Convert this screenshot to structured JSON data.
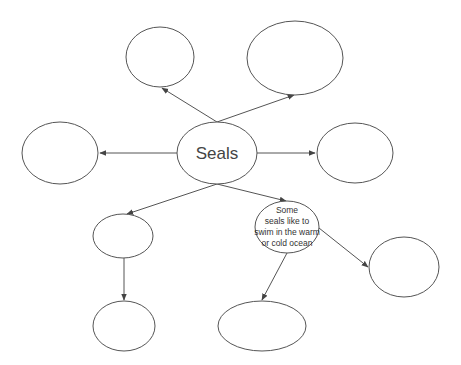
{
  "diagram": {
    "type": "concept-map",
    "colors": {
      "stroke": "#555555",
      "text": "#444444",
      "background": "#ffffff"
    },
    "center": {
      "id": "seals",
      "label": "Seals"
    },
    "nodes": [
      {
        "id": "seals",
        "label": "Seals"
      },
      {
        "id": "top-left",
        "label": ""
      },
      {
        "id": "top-right",
        "label": ""
      },
      {
        "id": "left",
        "label": ""
      },
      {
        "id": "right",
        "label": ""
      },
      {
        "id": "mid-left",
        "label": ""
      },
      {
        "id": "swim",
        "label": "Some seals like to swim in the warm or cold ocean",
        "lines": [
          "Some",
          "seals like to",
          "swim in the warm",
          "or cold ocean"
        ]
      },
      {
        "id": "bottom-left",
        "label": ""
      },
      {
        "id": "bottom-mid",
        "label": ""
      },
      {
        "id": "far-right",
        "label": ""
      }
    ],
    "edges": [
      {
        "from": "seals",
        "to": "top-left"
      },
      {
        "from": "seals",
        "to": "top-right"
      },
      {
        "from": "seals",
        "to": "left"
      },
      {
        "from": "seals",
        "to": "right"
      },
      {
        "from": "seals",
        "to": "mid-left"
      },
      {
        "from": "seals",
        "to": "swim"
      },
      {
        "from": "mid-left",
        "to": "bottom-left"
      },
      {
        "from": "swim",
        "to": "bottom-mid"
      },
      {
        "from": "swim",
        "to": "far-right"
      }
    ]
  }
}
